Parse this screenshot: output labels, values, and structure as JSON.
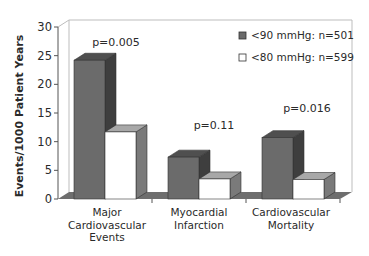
{
  "chart_data": {
    "type": "bar",
    "style": "3d-clustered-column",
    "title": "",
    "xlabel": "",
    "ylabel": "Events/1000 Patient Years",
    "ylim": [
      0,
      30
    ],
    "yticks": [
      0,
      5,
      10,
      15,
      20,
      25,
      30
    ],
    "grid": false,
    "legend_position": "top-right-inside",
    "categories": [
      [
        "Major",
        "Cardiovascular",
        "Events"
      ],
      [
        "Myocardial",
        "Infarction"
      ],
      [
        "Cardiovascular",
        "Mortality"
      ]
    ],
    "category_names": [
      "Major Cardiovascular Events",
      "Myocardial Infarction",
      "Cardiovascular Mortality"
    ],
    "series": [
      {
        "name": "<90 mmHg: n=501",
        "color": "#6b6b6b",
        "values": [
          24.2,
          7.3,
          10.7
        ]
      },
      {
        "name": "<80 mmHg: n=599",
        "color": "#ffffff",
        "values": [
          11.7,
          3.5,
          3.4
        ]
      }
    ],
    "annotations": [
      "p=0.005",
      "p=0.11",
      "p=0.016"
    ]
  },
  "colors": {
    "dark_front": "#6b6b6b",
    "dark_side": "#3e3e3e",
    "dark_top": "#4f4f4f",
    "light_front": "#ffffff",
    "light_side": "#7a7a7a",
    "light_top": "#a8a8a8",
    "floor": "#6e6e6e",
    "axis": "#555555",
    "wall": "#bdbdbd"
  }
}
